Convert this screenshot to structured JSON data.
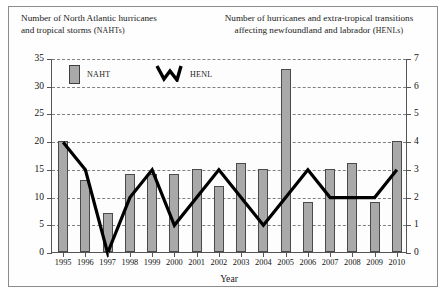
{
  "figure": {
    "title_left_line1": "Number of North Atlantic hurricanes",
    "title_left_line2": "and tropical storms (",
    "title_left_abbr": "NAHT",
    "title_left_abbr_tail": "s)",
    "title_right_line1": "Number of hurricanes and extra-tropical transitions",
    "title_right_line2": "affecting newfoundland and labrador (",
    "title_right_abbr": "HENL",
    "title_right_abbr_tail": "s)"
  },
  "legend": {
    "bar_label": "NAHT",
    "line_label": "HENL"
  },
  "axes": {
    "x_title": "Year",
    "left_ticks": [
      "0",
      "5",
      "10",
      "15",
      "20",
      "25",
      "30",
      "35"
    ],
    "right_ticks": [
      "0",
      "1",
      "2",
      "3",
      "4",
      "5",
      "6",
      "7"
    ]
  },
  "colors": {
    "bar_fill": "#a9a9a9",
    "bar_border": "#4a4a4a",
    "line": "#000000",
    "grid": "#808080",
    "axis": "#555555",
    "frame": "#8c8c8c"
  },
  "chart_data": {
    "type": "bar",
    "xlabel": "Year",
    "ylabel": "Number of North Atlantic hurricanes and tropical storms (NAHTs)",
    "y2label": "Number of hurricanes and extra-tropical transitions affecting newfoundland and labrador (HENLs)",
    "categories": [
      "1995",
      "1996",
      "1997",
      "1998",
      "1999",
      "2000",
      "2001",
      "2002",
      "2003",
      "2004",
      "2005",
      "2006",
      "2007",
      "2008",
      "2009",
      "2010"
    ],
    "ylim": [
      0,
      35
    ],
    "y2lim": [
      0,
      7
    ],
    "ytick_step": 5,
    "y2tick_step": 1,
    "grid": true,
    "legend_position": "inside-top-left",
    "series": [
      {
        "name": "NAHT",
        "type": "bar",
        "axis": "left",
        "values": [
          20,
          13,
          7,
          14,
          14,
          14,
          15,
          12,
          16,
          15,
          33,
          9,
          15,
          16,
          9,
          20
        ]
      },
      {
        "name": "HENL",
        "type": "line",
        "axis": "right",
        "values": [
          4,
          3,
          0,
          2,
          3,
          1,
          2,
          3,
          2,
          1,
          2,
          3,
          2,
          2,
          2,
          3
        ]
      }
    ]
  }
}
